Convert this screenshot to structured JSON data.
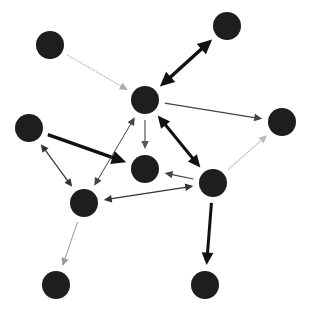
{
  "diagram": {
    "type": "directed-network",
    "background": "#ffffff",
    "node_color": "#1e1e1e",
    "node_radius": 14,
    "nodes": [
      {
        "id": "n1",
        "x": 50,
        "y": 45
      },
      {
        "id": "n2",
        "x": 227,
        "y": 26
      },
      {
        "id": "n3",
        "x": 145,
        "y": 100
      },
      {
        "id": "n4",
        "x": 282,
        "y": 122
      },
      {
        "id": "n5",
        "x": 29,
        "y": 128
      },
      {
        "id": "n6",
        "x": 145,
        "y": 169
      },
      {
        "id": "n7",
        "x": 213,
        "y": 183
      },
      {
        "id": "n8",
        "x": 84,
        "y": 203
      },
      {
        "id": "n9",
        "x": 56,
        "y": 285
      },
      {
        "id": "n10",
        "x": 205,
        "y": 285
      }
    ],
    "edges": [
      {
        "from": "n1",
        "to": "n3",
        "bidirectional": false,
        "width": 1,
        "color": "#aaaaaa",
        "dashed": true
      },
      {
        "from": "n2",
        "to": "n3",
        "bidirectional": true,
        "width": 3.5,
        "color": "#111111"
      },
      {
        "from": "n3",
        "to": "n4",
        "bidirectional": false,
        "width": 1.2,
        "color": "#444444"
      },
      {
        "from": "n3",
        "to": "n6",
        "bidirectional": false,
        "width": 1.2,
        "color": "#555555"
      },
      {
        "from": "n3",
        "to": "n7",
        "bidirectional": true,
        "width": 3,
        "color": "#111111"
      },
      {
        "from": "n5",
        "to": "n6",
        "bidirectional": false,
        "width": 3.5,
        "color": "#111111"
      },
      {
        "from": "n5",
        "to": "n8",
        "bidirectional": true,
        "width": 1.2,
        "color": "#333333"
      },
      {
        "from": "n8",
        "to": "n3",
        "bidirectional": true,
        "width": 1,
        "color": "#444444"
      },
      {
        "from": "n7",
        "to": "n6",
        "bidirectional": false,
        "width": 1.2,
        "color": "#444444"
      },
      {
        "from": "n8",
        "to": "n7",
        "bidirectional": true,
        "width": 1.2,
        "color": "#333333"
      },
      {
        "from": "n7",
        "to": "n4",
        "bidirectional": false,
        "width": 1,
        "color": "#bbbbbb"
      },
      {
        "from": "n8",
        "to": "n9",
        "bidirectional": false,
        "width": 1,
        "color": "#999999"
      },
      {
        "from": "n7",
        "to": "n10",
        "bidirectional": false,
        "width": 3,
        "color": "#111111"
      }
    ]
  }
}
